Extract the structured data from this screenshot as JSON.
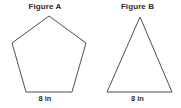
{
  "page": {
    "background_color": "#ffffff",
    "stroke_color": "#3a3a3a",
    "text_color": "#2b2b2b"
  },
  "figures": [
    {
      "id": "figure-a",
      "title": "Figure A",
      "shape_name": "pentagon",
      "shape_sides": 5,
      "base_label": "8 in",
      "base_length_value": 8,
      "base_length_unit": "in",
      "points": "49,16 86,43 72,92 26,92 12,43"
    },
    {
      "id": "figure-b",
      "title": "Figure B",
      "shape_name": "triangle",
      "shape_sides": 3,
      "base_label": "8 in",
      "base_length_value": 8,
      "base_length_unit": "in",
      "points": "48,17 80,92 15,92"
    }
  ]
}
